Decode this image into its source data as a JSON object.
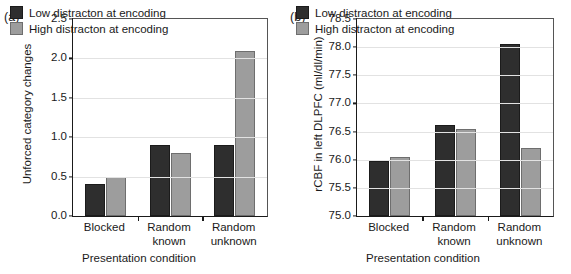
{
  "figure": {
    "panels": [
      {
        "tag": "(a)",
        "legend": [
          {
            "label": "Low distracton at encoding",
            "color": "#2e2e2e"
          },
          {
            "label": "High distracton at encoding",
            "color": "#9d9d9d"
          }
        ],
        "chart_data": {
          "type": "bar",
          "title": "",
          "xlabel": "Presentation condition",
          "ylabel": "Unforced category changes",
          "categories": [
            "Blocked",
            "Random known",
            "Random unknown"
          ],
          "category_lines": [
            [
              "Blocked"
            ],
            [
              "Random",
              "known"
            ],
            [
              "Random",
              "unknown"
            ]
          ],
          "series": [
            {
              "name": "Low distracton at encoding",
              "color": "#2e2e2e",
              "values": [
                0.4,
                0.9,
                0.9
              ]
            },
            {
              "name": "High distracton at encoding",
              "color": "#9d9d9d",
              "values": [
                0.5,
                0.8,
                2.1
              ]
            }
          ],
          "ylim": [
            0.0,
            2.5
          ],
          "yticks": [
            0.0,
            0.5,
            1.0,
            1.5,
            2.0,
            2.5
          ],
          "ytick_labels": [
            "0.0",
            "0.5",
            "1.0",
            "1.5",
            "2.0",
            "2.5"
          ],
          "grid": true,
          "legend_position": "top-left"
        }
      },
      {
        "tag": "(b)",
        "legend": [
          {
            "label": "Low distracton at encoding",
            "color": "#2e2e2e"
          },
          {
            "label": "High distracton at encoding",
            "color": "#9d9d9d"
          }
        ],
        "chart_data": {
          "type": "bar",
          "title": "",
          "xlabel": "Presentation condition",
          "ylabel": "rCBF in left DLPFC (ml/dl/min)",
          "categories": [
            "Blocked",
            "Random known",
            "Random unknown"
          ],
          "category_lines": [
            [
              "Blocked"
            ],
            [
              "Random",
              "known"
            ],
            [
              "Random",
              "unknown"
            ]
          ],
          "series": [
            {
              "name": "Low distracton at encoding",
              "color": "#2e2e2e",
              "values": [
                75.97,
                76.62,
                78.05
              ]
            },
            {
              "name": "High distracton at encoding",
              "color": "#9d9d9d",
              "values": [
                76.05,
                76.54,
                76.21
              ]
            }
          ],
          "ylim": [
            75.0,
            78.5
          ],
          "yticks": [
            75.0,
            75.5,
            76.0,
            76.5,
            77.0,
            77.5,
            78.0,
            78.5
          ],
          "ytick_labels": [
            "75.0",
            "75.5",
            "76.0",
            "76.5",
            "77.0",
            "77.5",
            "78.0",
            "78.5"
          ],
          "grid": true,
          "legend_position": "top-left"
        }
      }
    ]
  }
}
